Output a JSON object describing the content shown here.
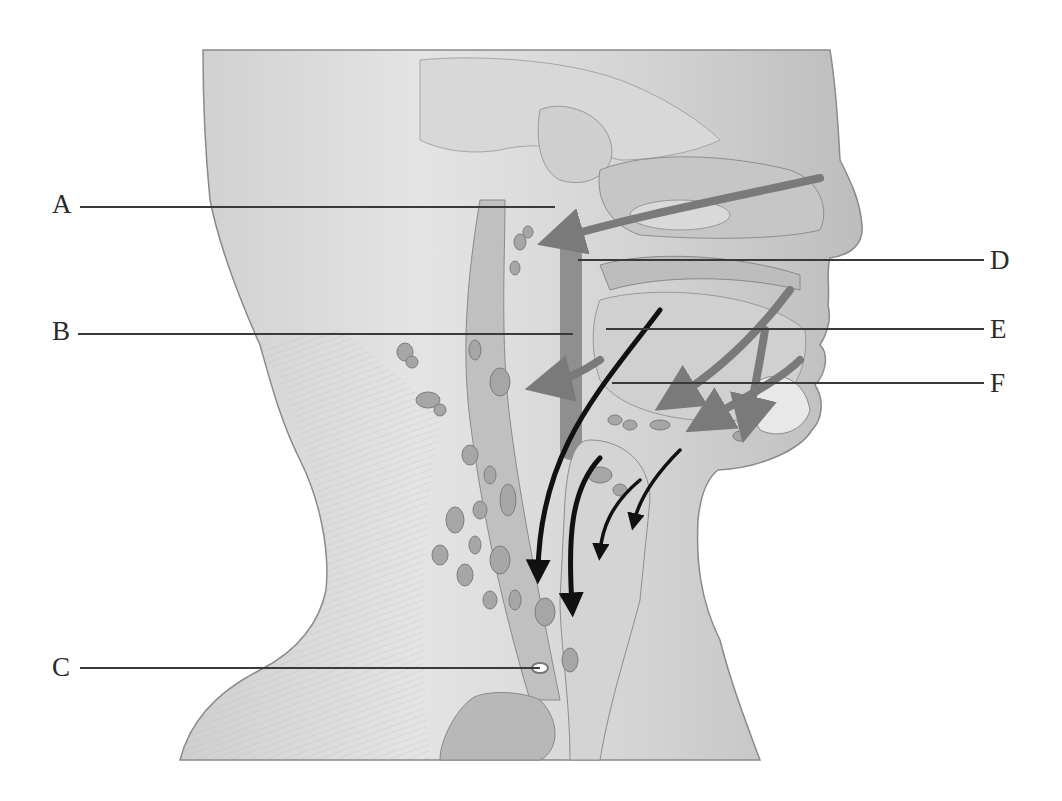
{
  "figure": {
    "background": "#ffffff",
    "colors": {
      "skin_light": "#e6e6e6",
      "skin_mid": "#c8c8c8",
      "skin_dark": "#9a9a9a",
      "node_fill": "#a8a8a8",
      "gray_arrow": "#7a7a7a",
      "black_arrow": "#111111",
      "leader_line": "#3a3a3a",
      "label_text": "#2a2a2a"
    }
  },
  "labels": [
    {
      "id": "A",
      "text": "A",
      "side": "left",
      "label_x": 52,
      "label_y": 191,
      "line_x1": 80,
      "line_x2": 555,
      "line_y": 206
    },
    {
      "id": "B",
      "text": "B",
      "side": "left",
      "label_x": 52,
      "label_y": 318,
      "line_x1": 78,
      "line_x2": 573,
      "line_y": 333
    },
    {
      "id": "C",
      "text": "C",
      "side": "left",
      "label_x": 52,
      "label_y": 654,
      "line_x1": 80,
      "line_x2": 540,
      "line_y": 667
    },
    {
      "id": "D",
      "text": "D",
      "side": "right",
      "label_x": 990,
      "label_y": 247,
      "line_x1": 578,
      "line_x2": 984,
      "line_y": 259
    },
    {
      "id": "E",
      "text": "E",
      "side": "right",
      "label_x": 990,
      "label_y": 316,
      "line_x1": 606,
      "line_x2": 984,
      "line_y": 328
    },
    {
      "id": "F",
      "text": "F",
      "side": "right",
      "label_x": 990,
      "label_y": 370,
      "line_x1": 612,
      "line_x2": 984,
      "line_y": 382
    }
  ],
  "arrows": {
    "gray": [
      {
        "name": "nasal-to-retropharyngeal",
        "path": "M 820 178 C 720 200 640 215 560 238"
      },
      {
        "name": "tongue-to-submandibular",
        "path": "M 790 290 C 760 330 720 370 675 398"
      },
      {
        "name": "lip-to-submental",
        "path": "M 800 360 C 780 380 740 400 706 420"
      },
      {
        "name": "chin-to-submental",
        "path": "M 765 330 C 760 360 755 390 748 420"
      },
      {
        "name": "pharynx-to-deep",
        "path": "M 600 360 C 585 370 565 380 548 384"
      }
    ],
    "black": [
      {
        "name": "tongue-to-jugulodigastric",
        "path": "M 660 310 C 600 390 540 450 538 572"
      },
      {
        "name": "larynx-to-deep-cervical",
        "path": "M 600 458 C 570 490 568 540 572 605"
      },
      {
        "name": "larynx-to-paratracheal",
        "path": "M 640 480 C 610 505 602 530 600 552"
      },
      {
        "name": "thyroid-to-pretracheal",
        "path": "M 680 450 C 660 470 640 495 634 522"
      }
    ]
  }
}
